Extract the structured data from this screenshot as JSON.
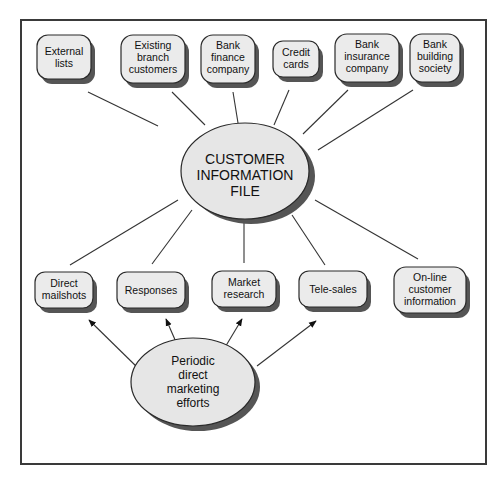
{
  "diagram": {
    "center": {
      "id": "customer-information-file",
      "lines": [
        "CUSTOMER",
        "INFORMATION",
        "FILE"
      ]
    },
    "sources": [
      {
        "id": "external-lists",
        "lines": [
          "External",
          "lists"
        ]
      },
      {
        "id": "existing-branch-customers",
        "lines": [
          "Existing",
          "branch",
          "customers"
        ]
      },
      {
        "id": "bank-finance-company",
        "lines": [
          "Bank",
          "finance",
          "company"
        ]
      },
      {
        "id": "credit-cards",
        "lines": [
          "Credit",
          "cards"
        ]
      },
      {
        "id": "bank-insurance-company",
        "lines": [
          "Bank",
          "insurance",
          "company"
        ]
      },
      {
        "id": "bank-building-society",
        "lines": [
          "Bank",
          "building",
          "society"
        ]
      }
    ],
    "channels": [
      {
        "id": "direct-mailshots",
        "lines": [
          "Direct",
          "mailshots"
        ]
      },
      {
        "id": "responses",
        "lines": [
          "Responses"
        ]
      },
      {
        "id": "market-research",
        "lines": [
          "Market",
          "research"
        ]
      },
      {
        "id": "tele-sales",
        "lines": [
          "Tele-sales"
        ]
      },
      {
        "id": "online-customer-information",
        "lines": [
          "On-line",
          "customer",
          "information"
        ]
      }
    ],
    "driver": {
      "id": "periodic-direct-marketing-efforts",
      "lines": [
        "Periodic",
        "direct",
        "marketing",
        "efforts"
      ]
    },
    "colors": {
      "node_fill": "#ebebeb",
      "shadow": "#555555",
      "stroke": "#2a2a2a"
    }
  }
}
